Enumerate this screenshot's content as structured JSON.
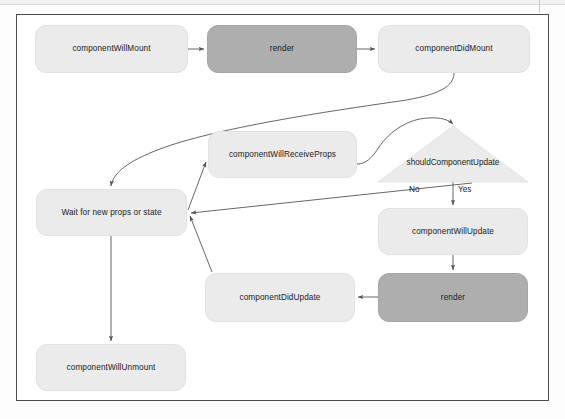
{
  "figure": {
    "nodes": [
      {
        "id": "componentWillMount",
        "label": "componentWillMount",
        "shape": "rounded-rect",
        "style": "light",
        "x": 35,
        "y": 25,
        "w": 153,
        "h": 48
      },
      {
        "id": "renderMount",
        "label": "render",
        "shape": "rounded-rect",
        "style": "dark",
        "x": 207,
        "y": 25,
        "w": 150,
        "h": 48
      },
      {
        "id": "componentDidMount",
        "label": "componentDidMount",
        "shape": "rounded-rect",
        "style": "light",
        "x": 378,
        "y": 25,
        "w": 152,
        "h": 48
      },
      {
        "id": "componentWillReceiveProps",
        "label": "componentWillReceiveProps",
        "shape": "rounded-rect",
        "style": "light",
        "x": 208,
        "y": 131,
        "w": 149,
        "h": 47
      },
      {
        "id": "shouldComponentUpdate",
        "label": "shouldComponentUpdate",
        "shape": "triangle",
        "style": "light",
        "x": 378,
        "y": 126,
        "w": 150,
        "h": 56
      },
      {
        "id": "waitForProps",
        "label": "Wait for new props or state",
        "shape": "rounded-rect",
        "style": "light",
        "x": 36,
        "y": 189,
        "w": 151,
        "h": 47
      },
      {
        "id": "componentWillUpdate",
        "label": "componentWillUpdate",
        "shape": "rounded-rect",
        "style": "light",
        "x": 378,
        "y": 208,
        "w": 150,
        "h": 47
      },
      {
        "id": "componentDidUpdate",
        "label": "componentDidUpdate",
        "shape": "rounded-rect",
        "style": "light",
        "x": 205,
        "y": 273,
        "w": 150,
        "h": 49
      },
      {
        "id": "renderUpdate",
        "label": "render",
        "shape": "rounded-rect",
        "style": "dark",
        "x": 378,
        "y": 273,
        "w": 150,
        "h": 49
      },
      {
        "id": "componentWillUnmount",
        "label": "componentWillUnmount",
        "shape": "rounded-rect",
        "style": "light",
        "x": 36,
        "y": 344,
        "w": 150,
        "h": 47
      }
    ],
    "edge_labels": [
      {
        "id": "no",
        "text": "No",
        "x": 409,
        "y": 185
      },
      {
        "id": "yes",
        "text": "Yes",
        "x": 458,
        "y": 185
      }
    ],
    "edges": [
      {
        "from": "componentWillMount",
        "to": "renderMount",
        "kind": "straight"
      },
      {
        "from": "renderMount",
        "to": "componentDidMount",
        "kind": "straight"
      },
      {
        "from": "componentDidMount",
        "to": "waitForProps",
        "kind": "curve"
      },
      {
        "from": "componentWillReceiveProps",
        "to": "shouldComponentUpdate",
        "kind": "curve"
      },
      {
        "from": "shouldComponentUpdate",
        "to": "waitForProps",
        "kind": "straight",
        "label": "No"
      },
      {
        "from": "shouldComponentUpdate",
        "to": "componentWillUpdate",
        "kind": "straight",
        "label": "Yes"
      },
      {
        "from": "componentWillUpdate",
        "to": "renderUpdate",
        "kind": "straight"
      },
      {
        "from": "renderUpdate",
        "to": "componentDidUpdate",
        "kind": "straight"
      },
      {
        "from": "componentDidUpdate",
        "to": "waitForProps",
        "kind": "straight"
      },
      {
        "from": "waitForProps",
        "to": "componentWillReceiveProps",
        "kind": "straight"
      },
      {
        "from": "waitForProps",
        "to": "componentWillUnmount",
        "kind": "straight"
      }
    ],
    "colors": {
      "light_node_fill": "#ebebeb",
      "dark_node_fill": "#aeaeae",
      "triangle_fill": "#ebebeb",
      "edge_stroke": "#555555",
      "frame_border": "#4a4a4a",
      "text": "#1a1a1a",
      "page_background": "#ffffff"
    }
  }
}
